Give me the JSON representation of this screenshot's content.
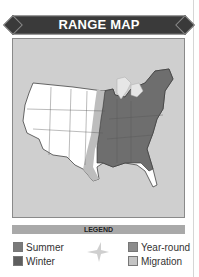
{
  "header": {
    "title": "RANGE MAP"
  },
  "map": {
    "description": "United States range map",
    "colors": {
      "background": "#cfcfcf",
      "land": "#ffffff",
      "year_round": "#6e6e6e",
      "migration": "#bdbdbd",
      "lakes": "#e6e6e6"
    }
  },
  "legend": {
    "title": "LEGEND",
    "items": [
      {
        "label": "Summer",
        "color": "#7a7a7a",
        "icon": "summer-swatch"
      },
      {
        "label": "Winter",
        "color": "#5e5e5e",
        "icon": "winter-swatch"
      },
      {
        "label": "Year-round",
        "color": "#8c8c8c",
        "icon": "year-round-swatch"
      },
      {
        "label": "Migration",
        "color": "#c4c4c4",
        "icon": "migration-swatch"
      }
    ],
    "center_icon": "bird-silhouette-icon"
  }
}
